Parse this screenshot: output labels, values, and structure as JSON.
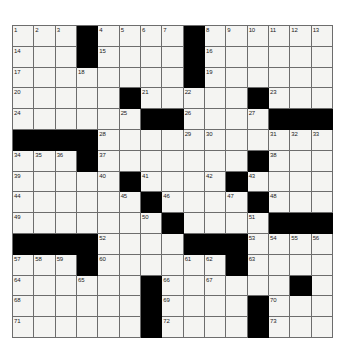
{
  "puzzle": {
    "kind": "crossword-grid",
    "rows": 15,
    "cols": 15,
    "colors": {
      "block": "#000000",
      "cell": "#f4f4f2",
      "grid_line": "#6d6d6d",
      "number_text": "#1a1a1a",
      "page_background": "#ffffff"
    },
    "blocks": [
      [
        0,
        3
      ],
      [
        0,
        8
      ],
      [
        1,
        3
      ],
      [
        1,
        8
      ],
      [
        2,
        8
      ],
      [
        3,
        5
      ],
      [
        3,
        11
      ],
      [
        4,
        6
      ],
      [
        4,
        7
      ],
      [
        4,
        12
      ],
      [
        4,
        13
      ],
      [
        4,
        14
      ],
      [
        5,
        0
      ],
      [
        5,
        1
      ],
      [
        5,
        2
      ],
      [
        5,
        3
      ],
      [
        6,
        3
      ],
      [
        6,
        11
      ],
      [
        7,
        5
      ],
      [
        7,
        10
      ],
      [
        8,
        6
      ],
      [
        8,
        11
      ],
      [
        9,
        7
      ],
      [
        9,
        12
      ],
      [
        9,
        13
      ],
      [
        9,
        14
      ],
      [
        10,
        0
      ],
      [
        10,
        1
      ],
      [
        10,
        2
      ],
      [
        10,
        3
      ],
      [
        10,
        8
      ],
      [
        10,
        9
      ],
      [
        10,
        10
      ],
      [
        11,
        3
      ],
      [
        11,
        10
      ],
      [
        12,
        6
      ],
      [
        12,
        13
      ],
      [
        13,
        6
      ],
      [
        13,
        11
      ],
      [
        14,
        6
      ],
      [
        14,
        11
      ]
    ],
    "numbers": [
      {
        "row": 0,
        "col": 0,
        "n": "1"
      },
      {
        "row": 0,
        "col": 1,
        "n": "2"
      },
      {
        "row": 0,
        "col": 2,
        "n": "3"
      },
      {
        "row": 0,
        "col": 4,
        "n": "4"
      },
      {
        "row": 0,
        "col": 5,
        "n": "5"
      },
      {
        "row": 0,
        "col": 6,
        "n": "6"
      },
      {
        "row": 0,
        "col": 7,
        "n": "7"
      },
      {
        "row": 0,
        "col": 9,
        "n": "8"
      },
      {
        "row": 0,
        "col": 10,
        "n": "9"
      },
      {
        "row": 0,
        "col": 11,
        "n": "10"
      },
      {
        "row": 0,
        "col": 12,
        "n": "11"
      },
      {
        "row": 0,
        "col": 13,
        "n": "12"
      },
      {
        "row": 0,
        "col": 14,
        "n": "13"
      },
      {
        "row": 1,
        "col": 0,
        "n": "14"
      },
      {
        "row": 1,
        "col": 4,
        "n": "15"
      },
      {
        "row": 1,
        "col": 9,
        "n": "16"
      },
      {
        "row": 2,
        "col": 0,
        "n": "17"
      },
      {
        "row": 2,
        "col": 3,
        "n": "18"
      },
      {
        "row": 2,
        "col": 9,
        "n": "19"
      },
      {
        "row": 3,
        "col": 0,
        "n": "20"
      },
      {
        "row": 3,
        "col": 6,
        "n": "21"
      },
      {
        "row": 3,
        "col": 8,
        "n": "22"
      },
      {
        "row": 3,
        "col": 12,
        "n": "23"
      },
      {
        "row": 4,
        "col": 0,
        "n": "24"
      },
      {
        "row": 4,
        "col": 5,
        "n": "25"
      },
      {
        "row": 4,
        "col": 8,
        "n": "26"
      },
      {
        "row": 4,
        "col": 11,
        "n": "27"
      },
      {
        "row": 5,
        "col": 4,
        "n": "28"
      },
      {
        "row": 5,
        "col": 8,
        "n": "29"
      },
      {
        "row": 5,
        "col": 9,
        "n": "30"
      },
      {
        "row": 5,
        "col": 12,
        "n": "31"
      },
      {
        "row": 5,
        "col": 13,
        "n": "32"
      },
      {
        "row": 5,
        "col": 14,
        "n": "33"
      },
      {
        "row": 6,
        "col": 0,
        "n": "34"
      },
      {
        "row": 6,
        "col": 1,
        "n": "35"
      },
      {
        "row": 6,
        "col": 2,
        "n": "36"
      },
      {
        "row": 6,
        "col": 4,
        "n": "37"
      },
      {
        "row": 6,
        "col": 12,
        "n": "38"
      },
      {
        "row": 7,
        "col": 0,
        "n": "39"
      },
      {
        "row": 7,
        "col": 4,
        "n": "40"
      },
      {
        "row": 7,
        "col": 6,
        "n": "41"
      },
      {
        "row": 7,
        "col": 9,
        "n": "42"
      },
      {
        "row": 7,
        "col": 11,
        "n": "43"
      },
      {
        "row": 8,
        "col": 0,
        "n": "44"
      },
      {
        "row": 8,
        "col": 5,
        "n": "45"
      },
      {
        "row": 8,
        "col": 7,
        "n": "46"
      },
      {
        "row": 8,
        "col": 10,
        "n": "47"
      },
      {
        "row": 8,
        "col": 12,
        "n": "48"
      },
      {
        "row": 9,
        "col": 0,
        "n": "49"
      },
      {
        "row": 9,
        "col": 6,
        "n": "50"
      },
      {
        "row": 9,
        "col": 11,
        "n": "51"
      },
      {
        "row": 10,
        "col": 4,
        "n": "52"
      },
      {
        "row": 10,
        "col": 11,
        "n": "53"
      },
      {
        "row": 10,
        "col": 12,
        "n": "54"
      },
      {
        "row": 10,
        "col": 13,
        "n": "55"
      },
      {
        "row": 10,
        "col": 14,
        "n": "56"
      },
      {
        "row": 11,
        "col": 0,
        "n": "57"
      },
      {
        "row": 11,
        "col": 1,
        "n": "58"
      },
      {
        "row": 11,
        "col": 2,
        "n": "59"
      },
      {
        "row": 11,
        "col": 4,
        "n": "60"
      },
      {
        "row": 11,
        "col": 8,
        "n": "61"
      },
      {
        "row": 11,
        "col": 9,
        "n": "62"
      },
      {
        "row": 11,
        "col": 11,
        "n": "63"
      },
      {
        "row": 12,
        "col": 0,
        "n": "64"
      },
      {
        "row": 12,
        "col": 3,
        "n": "65"
      },
      {
        "row": 12,
        "col": 7,
        "n": "66"
      },
      {
        "row": 12,
        "col": 9,
        "n": "67"
      },
      {
        "row": 13,
        "col": 0,
        "n": "68"
      },
      {
        "row": 13,
        "col": 7,
        "n": "69"
      },
      {
        "row": 13,
        "col": 12,
        "n": "70"
      },
      {
        "row": 14,
        "col": 0,
        "n": "71"
      },
      {
        "row": 14,
        "col": 7,
        "n": "72"
      },
      {
        "row": 14,
        "col": 12,
        "n": "73"
      }
    ],
    "letters": []
  }
}
